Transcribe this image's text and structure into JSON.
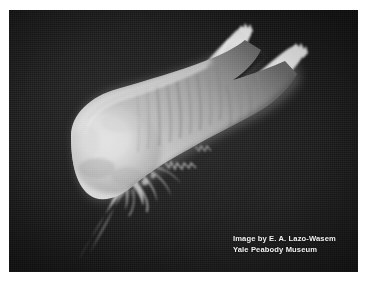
{
  "page": {
    "background_color": "#ffffff",
    "width": 371,
    "height": 289
  },
  "photo": {
    "name": "specimen-photograph",
    "background_color": "#151515",
    "border_color": "#ffffff",
    "subject": "pale translucent marine invertebrate specimen (holothurian / sea cucumber) on black background",
    "highlight_color": "#d4d4d4",
    "midtone_color": "#9a9a9a",
    "shadow_color": "#4a4a4a"
  },
  "caption": {
    "line1": "Image by E. A. Lazo-Wasem",
    "line2": "Yale Peabody Museum",
    "color": "#f2f2f2"
  }
}
